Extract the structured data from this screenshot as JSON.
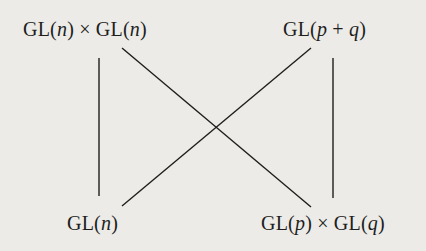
{
  "diagram": {
    "nodes": {
      "top_left": {
        "parts": [
          "GL(",
          "n",
          ") × GL(",
          "n",
          ")"
        ],
        "text": "GL(n) × GL(n)"
      },
      "top_right": {
        "parts": [
          "GL(",
          "p",
          " + ",
          "q",
          ")"
        ],
        "text": "GL(p + q)"
      },
      "bottom_left": {
        "parts": [
          "GL(",
          "n",
          ")"
        ],
        "text": "GL(n)"
      },
      "bottom_right": {
        "parts": [
          "GL(",
          "p",
          ") × GL(",
          "q",
          ")"
        ],
        "text": "GL(p) × GL(q)"
      }
    },
    "edges": [
      {
        "from": "top_left",
        "to": "bottom_left",
        "x1": 99,
        "y1": 58,
        "x2": 99,
        "y2": 196
      },
      {
        "from": "top_right",
        "to": "bottom_right",
        "x1": 333,
        "y1": 58,
        "x2": 333,
        "y2": 198
      },
      {
        "from": "top_left",
        "to": "bottom_right",
        "x1": 122,
        "y1": 48,
        "x2": 311,
        "y2": 207
      },
      {
        "from": "top_right",
        "to": "bottom_left",
        "x1": 311,
        "y1": 48,
        "x2": 122,
        "y2": 206
      }
    ],
    "colors": {
      "background": "#ecebe7",
      "ink": "#1e1e1e"
    }
  }
}
